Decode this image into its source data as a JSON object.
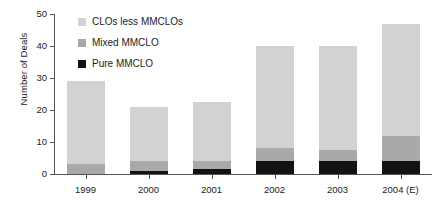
{
  "chart_data": {
    "type": "bar",
    "title": "",
    "subtitle": "",
    "xlabel": "",
    "ylabel": "Number of Deals",
    "stacked": true,
    "grid": false,
    "legend_position": "top-left",
    "ylim": [
      0,
      50
    ],
    "yticks": [
      0,
      10,
      20,
      30,
      40,
      50
    ],
    "ytick_labels": [
      "0",
      "10",
      "20",
      "30",
      "40",
      "50"
    ],
    "categories": [
      "1999",
      "2000",
      "2001",
      "2002",
      "2003",
      "2004 (E)"
    ],
    "series": [
      {
        "name": "Pure MMCLO",
        "color": "#121212",
        "values": [
          0,
          1,
          1.5,
          4,
          4,
          4
        ]
      },
      {
        "name": "Mixed MMCLO",
        "color": "#a9a9a9",
        "values": [
          3,
          3,
          2.5,
          4,
          3.5,
          8
        ]
      },
      {
        "name": "CLOs less MMCLOs",
        "color": "#d2d2d2",
        "values": [
          26,
          17,
          18.5,
          32,
          32.5,
          35
        ]
      }
    ],
    "totals": [
      29,
      21,
      22.5,
      40,
      40,
      47
    ]
  },
  "legend": {
    "items": [
      {
        "label": "CLOs less MMCLOs",
        "color": "#d2d2d2"
      },
      {
        "label": "Mixed MMCLO",
        "color": "#a9a9a9"
      },
      {
        "label": "Pure MMCLO",
        "color": "#121212"
      }
    ]
  },
  "axis": {
    "y_title": "Number of Deals"
  }
}
